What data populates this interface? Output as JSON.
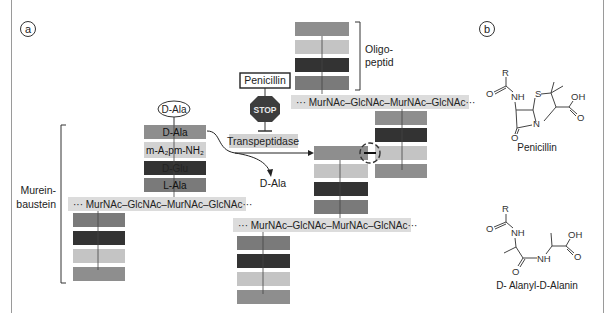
{
  "panels": {
    "a": {
      "label": "a"
    },
    "b": {
      "label": "b"
    }
  },
  "colors": {
    "block_mid": "#8e8e8e",
    "block_light": "#c4c4c4",
    "block_dark": "#333333",
    "block_gray": "#7a7a7a",
    "chain_bg": "#dcdcdc",
    "label_bg": "#d2d2d2",
    "stop": "#3d3d3d"
  },
  "panel_a": {
    "d_ala_free": "D-Ala",
    "penicillin_box": "Penicillin",
    "stop_sign": "STOP",
    "transpeptidase": "Transpeptidase",
    "released": "D-Ala",
    "oligopeptid_line1": "Oligo-",
    "oligopeptid_line2": "peptid",
    "murein_line1": "Murein-",
    "murein_line2": "baustein",
    "peptide_chain": [
      {
        "label": "D-Ala"
      },
      {
        "label": "m-A₂pm-NH₂"
      },
      {
        "label": "D-Glu"
      },
      {
        "label": "L-Ala"
      }
    ],
    "glycan_chains": [
      "··· MurNAc–GlcNAc–MurNAc–GlcNAc···",
      "··· MurNAc–GlcNAc–MurNAc–GlcNAc···",
      "··· MurNAc–GlcNAc–MurNAc–GlcNAc···"
    ]
  },
  "panel_b": {
    "structure1_name": "Penicillin",
    "structure2_name": "D- Alanyl-D-Alanin",
    "atoms": {
      "R": "R",
      "O": "O",
      "NH": "NH",
      "S": "S",
      "N": "N",
      "OH": "OH"
    }
  }
}
